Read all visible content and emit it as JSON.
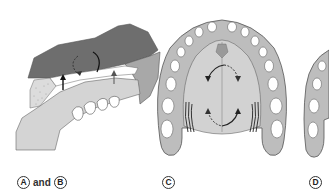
{
  "figure": {
    "panels": [
      {
        "id": "AB",
        "label_left": "A",
        "connector": "and",
        "label_right": "B",
        "view": "lateral view of maxilla and palate"
      },
      {
        "id": "C",
        "label": "C",
        "view": "occlusal view of palate with arrows"
      },
      {
        "id": "D",
        "label": "D",
        "view": "partial occlusal view of palate (cropped)"
      }
    ],
    "colors": {
      "dark_gray": "#6e6e6e",
      "mid_gray": "#b4b4b4",
      "light_gray": "#d6d6d6",
      "tooth_white": "#ffffff",
      "outline": "#555555",
      "arrow": "#222222"
    }
  }
}
